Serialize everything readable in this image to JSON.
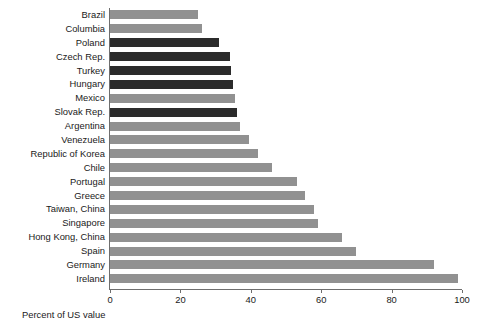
{
  "chart_data": {
    "type": "bar",
    "orientation": "horizontal",
    "title": "",
    "subtitle": "",
    "xlabel": "Percent of US value",
    "ylabel": "",
    "xlim": [
      0,
      100
    ],
    "ylim": null,
    "grid": false,
    "legend": null,
    "xticks": [
      0,
      20,
      40,
      60,
      80,
      100
    ],
    "xtick_labels": [
      "0",
      "20",
      "40",
      "60",
      "80",
      "100"
    ],
    "categories": [
      "Brazil",
      "Columbia",
      "Poland",
      "Czech Rep.",
      "Turkey",
      "Hungary",
      "Mexico",
      "Slovak Rep.",
      "Argentina",
      "Venezuela",
      "Republic of Korea",
      "Chile",
      "Portugal",
      "Greece",
      "Taiwan, China",
      "Singapore",
      "Hong Kong, China",
      "Spain",
      "Germany",
      "Ireland"
    ],
    "values": [
      25,
      26,
      31,
      34,
      34.5,
      35,
      35.5,
      36,
      37,
      39.5,
      42,
      46,
      53,
      55.5,
      58,
      59,
      66,
      70,
      92,
      99
    ],
    "bar_groups": [
      "a",
      "a",
      "b",
      "b",
      "b",
      "b",
      "a",
      "b",
      "a",
      "a",
      "a",
      "a",
      "a",
      "a",
      "a",
      "a",
      "a",
      "a",
      "a",
      "a"
    ],
    "colors": {
      "series_a": "#919191",
      "series_b": "#2b2b2b",
      "axis": "#6e6e6e",
      "text": "#1a1a1a",
      "background": "#ffffff"
    }
  }
}
